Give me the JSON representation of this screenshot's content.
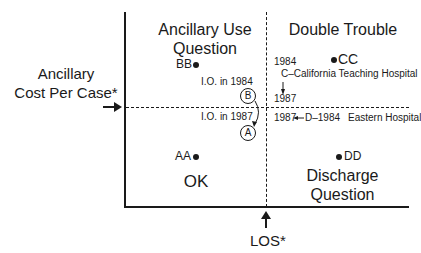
{
  "axes": {
    "y_label_line1": "Ancillary",
    "y_label_line2": "Cost Per Case*",
    "x_label": "LOS*"
  },
  "quadrants": {
    "top_left": {
      "line1": "Ancillary Use",
      "line2": "Question"
    },
    "top_right": {
      "line1": "Double Trouble"
    },
    "bottom_left": {
      "line1": "OK"
    },
    "bottom_right": {
      "line1": "Discharge",
      "line2": "Question"
    }
  },
  "points": {
    "bb": "BB",
    "aa": "AA",
    "cc": "CC",
    "dd": "DD"
  },
  "annotations": {
    "io_1984": "I.O. in 1984",
    "io_1987": "I.O. in 1987",
    "circle_b": "B",
    "circle_a": "A",
    "c_year_1984": "1984",
    "c_hospital": "C–California Teaching Hospital",
    "c_year_1987": "1987",
    "d_line_1987": "1987",
    "d_line_mid": "D–1984",
    "d_hospital": "Eastern Hospital"
  }
}
